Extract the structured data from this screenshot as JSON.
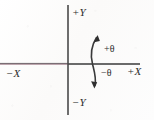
{
  "figure": {
    "type": "cartesian-axes-angle-convention-diagram",
    "background_color": "#fdfdfc",
    "ink_color": "#2b2b2b",
    "axis_tint_color": "#a98a95"
  },
  "axes": {
    "origin": {
      "x": 68,
      "y": 64
    },
    "vertical": {
      "x": 68,
      "y_top": 5,
      "y_bottom": 115
    },
    "horizontal": {
      "y": 64,
      "x_left": 0,
      "x_right": 140
    },
    "labels": {
      "positive_y": "+Y",
      "negative_y": "−Y",
      "negative_x": "−X",
      "positive_x": "+X"
    }
  },
  "angle_arrow": {
    "name": "double-headed-curved-rotation-arrow",
    "positive_label": "+θ",
    "negative_label": "−θ",
    "positive_direction": "counterclockwise-up",
    "negative_direction": "clockwise-down",
    "crosses_axis": "x-axis",
    "arc_center_x": 95
  }
}
